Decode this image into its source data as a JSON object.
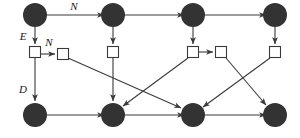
{
  "figure": {
    "type": "directed-graph-lattice",
    "width": 300,
    "height": 138,
    "background": "#ffffff",
    "stroke_color": "#3a3a3a",
    "node_fill_circle": "#333333",
    "node_fill_square": "#ffffff"
  },
  "labels": {
    "n_top": "N",
    "e_left": "E",
    "n_mid": "N",
    "d_left": "D"
  },
  "nodes": {
    "circles_top": [
      {
        "id": "c-top-1",
        "cx": 35,
        "cy": 15,
        "r": 12
      },
      {
        "id": "c-top-2",
        "cx": 113,
        "cy": 15,
        "r": 12
      },
      {
        "id": "c-top-3",
        "cx": 193,
        "cy": 15,
        "r": 12
      },
      {
        "id": "c-top-4",
        "cx": 275,
        "cy": 15,
        "r": 12
      }
    ],
    "squares_mid": [
      {
        "id": "s-mid-1",
        "cx": 35,
        "cy": 52,
        "size": 11
      },
      {
        "id": "s-mid-2",
        "cx": 63,
        "cy": 52,
        "size": 11
      },
      {
        "id": "s-mid-3",
        "cx": 113,
        "cy": 52,
        "size": 11
      },
      {
        "id": "s-mid-4",
        "cx": 193,
        "cy": 52,
        "size": 11
      },
      {
        "id": "s-mid-5",
        "cx": 221,
        "cy": 52,
        "size": 11
      },
      {
        "id": "s-mid-6",
        "cx": 275,
        "cy": 52,
        "size": 11
      }
    ],
    "circles_bottom": [
      {
        "id": "c-bot-1",
        "cx": 35,
        "cy": 115,
        "r": 12
      },
      {
        "id": "c-bot-2",
        "cx": 113,
        "cy": 115,
        "r": 12
      },
      {
        "id": "c-bot-3",
        "cx": 193,
        "cy": 115,
        "r": 12
      },
      {
        "id": "c-bot-4",
        "cx": 275,
        "cy": 115,
        "r": 12
      }
    ]
  },
  "edges": {
    "top_row": [
      {
        "from": "c-top-1",
        "to": "c-top-2",
        "label": "N"
      },
      {
        "from": "c-top-2",
        "to": "c-top-3",
        "label": ""
      },
      {
        "from": "c-top-3",
        "to": "c-top-4",
        "label": ""
      }
    ],
    "vertical_down": [
      {
        "from": "c-top-1",
        "to": "s-mid-1",
        "label": "E"
      },
      {
        "from": "c-top-2",
        "to": "s-mid-3",
        "label": ""
      },
      {
        "from": "c-top-3",
        "to": "s-mid-4",
        "label": ""
      },
      {
        "from": "c-top-4",
        "to": "s-mid-6",
        "label": ""
      }
    ],
    "mid_row": [
      {
        "from": "s-mid-1",
        "to": "s-mid-2",
        "label": "N"
      },
      {
        "from": "s-mid-4",
        "to": "s-mid-5",
        "label": ""
      }
    ],
    "vertical_to_bottom": [
      {
        "from": "s-mid-1",
        "to": "c-bot-1",
        "label": "D"
      },
      {
        "from": "s-mid-3",
        "to": "c-bot-2",
        "label": ""
      }
    ],
    "diagonals": [
      {
        "from": "s-mid-2",
        "to": "c-bot-3",
        "label": ""
      },
      {
        "from": "s-mid-4",
        "to": "c-bot-2",
        "label": ""
      },
      {
        "from": "s-mid-5",
        "to": "c-bot-4",
        "label": ""
      },
      {
        "from": "s-mid-6",
        "to": "c-bot-3",
        "label": ""
      }
    ],
    "bottom_row": [
      {
        "from": "c-bot-1",
        "to": "c-bot-2",
        "label": ""
      },
      {
        "from": "c-bot-2",
        "to": "c-bot-3",
        "label": ""
      },
      {
        "from": "c-bot-3",
        "to": "c-bot-4",
        "label": ""
      }
    ]
  }
}
